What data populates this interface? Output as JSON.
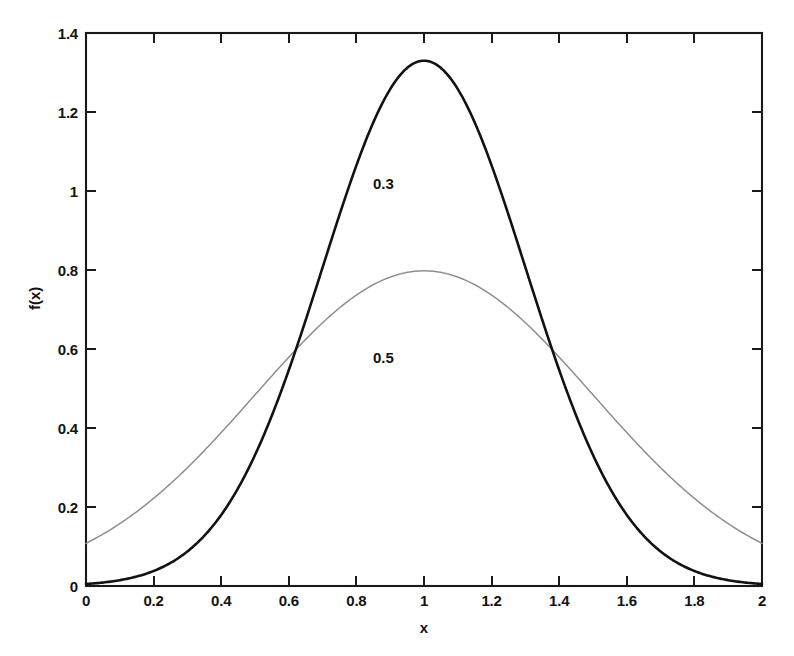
{
  "chart_data": {
    "type": "line",
    "title": "",
    "xlabel": "x",
    "ylabel": "f(x)",
    "xlim": [
      0,
      2
    ],
    "ylim": [
      0,
      1.4
    ],
    "grid": false,
    "legend_position": "inline-annotation",
    "x_ticks": [
      "0",
      "0.2",
      "0.4",
      "0.6",
      "0.8",
      "1",
      "1.2",
      "1.4",
      "1.6",
      "1.8",
      "2"
    ],
    "x_tick_values": [
      0,
      0.2,
      0.4,
      0.6,
      0.8,
      1,
      1.2,
      1.4,
      1.6,
      1.8,
      2
    ],
    "y_ticks": [
      "0",
      "0.2",
      "0.4",
      "0.6",
      "0.8",
      "1",
      "1.2",
      "1.4"
    ],
    "y_tick_values": [
      0,
      0.2,
      0.4,
      0.6,
      0.8,
      1,
      1.2,
      1.4
    ],
    "series": [
      {
        "name": "0.3",
        "annotation": "0.3",
        "annotation_x": 0.88,
        "annotation_y": 1.02,
        "color": "#121212",
        "style": "solid-thick",
        "mean": 1,
        "sigma": 0.3,
        "peak_value": 1.33,
        "x": [
          0,
          0.1,
          0.2,
          0.3,
          0.4,
          0.5,
          0.6,
          0.7,
          0.8,
          0.9,
          1.0,
          1.1,
          1.2,
          1.3,
          1.4,
          1.5,
          1.6,
          1.7,
          1.8,
          1.9,
          2.0
        ],
        "values": [
          0.005,
          0.017,
          0.051,
          0.131,
          0.295,
          0.577,
          0.983,
          1.456,
          1.874,
          2.0,
          1.33,
          1.296,
          1.196,
          1.046,
          0.867,
          0.683,
          0.513,
          0.366,
          0.249,
          0.161,
          0.099
        ]
      },
      {
        "name": "0.5",
        "annotation": "0.5",
        "annotation_x": 0.88,
        "annotation_y": 0.58,
        "color": "#8e8e8e",
        "style": "solid-thin",
        "mean": 1,
        "sigma": 0.5,
        "peak_value": 0.798,
        "x": [
          0,
          0.1,
          0.2,
          0.3,
          0.4,
          0.5,
          0.6,
          0.7,
          0.8,
          0.9,
          1.0,
          1.1,
          1.2,
          1.3,
          1.4,
          1.5,
          1.6,
          1.7,
          1.8,
          1.9,
          2.0
        ],
        "values": [
          0.108,
          0.158,
          0.222,
          0.298,
          0.386,
          0.484,
          0.579,
          0.666,
          0.737,
          0.783,
          0.798,
          0.783,
          0.737,
          0.666,
          0.579,
          0.484,
          0.386,
          0.298,
          0.222,
          0.158,
          0.108
        ]
      }
    ]
  },
  "annotations": {
    "curve_high_label": "0.3",
    "curve_low_label": "0.5"
  },
  "axes": {
    "x_title": "x",
    "y_title": "f(x)"
  },
  "caption": {
    "text": ""
  }
}
